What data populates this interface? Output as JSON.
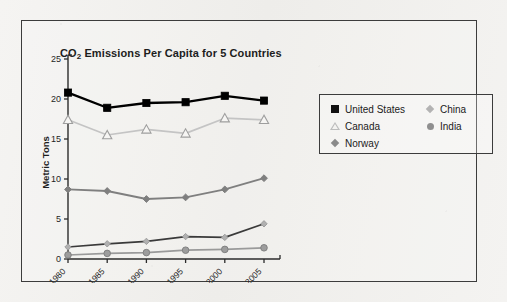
{
  "chart_data": {
    "type": "line",
    "title": "CO2 Emissions Per Capita for 5 Countries",
    "title_prefix": "CO",
    "title_sub": "2",
    "title_rest": " Emissions Per Capita for 5 Countries",
    "xlabel": "",
    "ylabel": "Metric Tons",
    "x": [
      1980,
      1985,
      1990,
      1995,
      2000,
      2005
    ],
    "categories": [
      "1980",
      "1985",
      "1990",
      "1995",
      "2000",
      "2005"
    ],
    "ylim": [
      0,
      25
    ],
    "yticks": [
      0,
      5,
      10,
      15,
      20,
      25
    ],
    "ytick_labels": [
      "0",
      "5",
      "10",
      "15",
      "20",
      "25"
    ],
    "grid": false,
    "legend_position": "right-top-inside",
    "series": [
      {
        "name": "United States",
        "values": [
          20.8,
          18.9,
          19.5,
          19.6,
          20.4,
          19.8
        ],
        "color": "#000000",
        "marker": "square-filled"
      },
      {
        "name": "Canada",
        "values": [
          17.4,
          15.5,
          16.2,
          15.7,
          17.6,
          17.4
        ],
        "color": "#c4c4c4",
        "marker": "triangle-open"
      },
      {
        "name": "Norway",
        "values": [
          8.7,
          8.5,
          7.5,
          7.7,
          8.7,
          10.1
        ],
        "color": "#7f7f7f",
        "marker": "diamond-filled"
      },
      {
        "name": "China",
        "values": [
          1.5,
          1.9,
          2.2,
          2.8,
          2.7,
          4.4
        ],
        "color": "#3a3a3a",
        "marker_color": "#b0b0b0",
        "marker": "diamond-small"
      },
      {
        "name": "India",
        "values": [
          0.5,
          0.7,
          0.8,
          1.1,
          1.2,
          1.4
        ],
        "color": "#9a9a9a",
        "marker_color": "#8f8f8f",
        "marker": "circle-filled"
      }
    ]
  },
  "legend": {
    "left_column": [
      {
        "label": "United States",
        "marker": "square-filled",
        "color": "#111111"
      },
      {
        "label": "Canada",
        "marker": "triangle-open",
        "color": "#b5b5b5"
      },
      {
        "label": "Norway",
        "marker": "diamond-filled",
        "color": "#8a8a8a"
      }
    ],
    "right_column": [
      {
        "label": "China",
        "marker": "diamond-small",
        "color": "#b3b3b3"
      },
      {
        "label": "India",
        "marker": "circle-filled",
        "color": "#8f8f8f"
      }
    ]
  },
  "axes": {
    "y_title": "Metric Tons",
    "y_ticks": [
      "25",
      "20",
      "15",
      "10",
      "5",
      "0"
    ],
    "x_ticks": [
      "1980",
      "1985",
      "1990",
      "1995",
      "2000",
      "2005"
    ]
  },
  "colors": {
    "frame": "#3c3c3c",
    "background": "#f2f1ef",
    "text": "#1d1d1d",
    "us": "#000000",
    "canada": "#c4c4c4",
    "norway": "#7f7f7f",
    "china": "#3a3a3a",
    "india": "#9a9a9a"
  }
}
